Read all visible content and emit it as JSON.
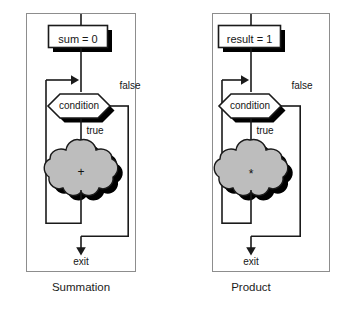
{
  "figure": {
    "background_color": "#ffffff",
    "line_color": "#1a1a1a",
    "shadow_color": "#000000",
    "blob_fill_color": "#bdbdbd",
    "box_fill_color": "#ffffff",
    "frame_color": "#8d8d8d"
  },
  "panels": [
    {
      "id": "summation",
      "caption": "Summation",
      "init_box_label": "sum = 0",
      "decision_label": "condition",
      "true_label": "true",
      "false_label": "false",
      "operation_symbol": "+",
      "exit_label": "exit"
    },
    {
      "id": "product",
      "caption": "Product",
      "init_box_label": "result = 1",
      "decision_label": "condition",
      "true_label": "true",
      "false_label": "false",
      "operation_symbol": "*",
      "exit_label": "exit"
    }
  ]
}
